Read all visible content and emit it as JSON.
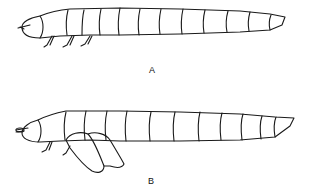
{
  "figure": {
    "panels": [
      {
        "id": "A",
        "label": "A",
        "subject": "larva, lateral view",
        "segments": 12
      },
      {
        "id": "B",
        "label": "B",
        "subject": "larva with everted appendage, lateral view",
        "segments": 12
      }
    ],
    "colors": {
      "line": "#1a1a1a",
      "background": "#ffffff"
    }
  }
}
